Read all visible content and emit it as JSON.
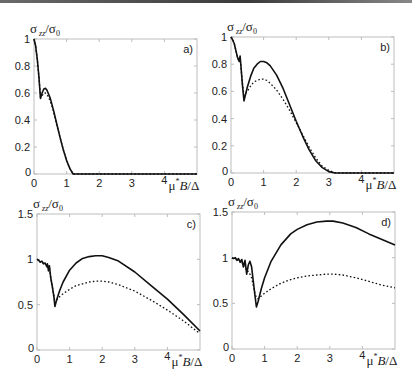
{
  "figure": {
    "ylabel": "σzz/σ0",
    "ylabel_main": "σ",
    "ylabel_sub": "zz",
    "ylabel_den": "σ",
    "ylabel_den_sub": "0",
    "xlabel": "4μ*B/Δ",
    "xlabel_num": "4",
    "xlabel_text": "μ*B/Δ"
  },
  "chart_data": [
    {
      "type": "line",
      "panel": "a)",
      "title": "",
      "ylabel": "σzz/σ0",
      "xlabel": "4μ*B/Δ",
      "xlim": [
        0,
        5
      ],
      "ylim": [
        0,
        1
      ],
      "x_ticks": [
        "0",
        "1",
        "2",
        "3",
        "4"
      ],
      "y_ticks": [
        "0",
        "0.2",
        "0.4",
        "0.6",
        "0.8",
        "1"
      ],
      "y_tick_values": [
        0,
        0.2,
        0.4,
        0.6,
        0.8,
        1
      ],
      "grid": false,
      "series": [
        {
          "name": "solid",
          "style": "solid",
          "x": [
            0,
            0.05,
            0.1,
            0.15,
            0.2,
            0.25,
            0.3,
            0.35,
            0.4,
            0.5,
            0.6,
            0.7,
            0.8,
            0.9,
            1.0,
            1.1,
            1.2,
            1.5,
            2,
            3,
            4,
            5
          ],
          "y": [
            1.0,
            0.95,
            0.85,
            0.72,
            0.56,
            0.6,
            0.63,
            0.635,
            0.62,
            0.56,
            0.47,
            0.37,
            0.27,
            0.18,
            0.1,
            0.04,
            0.0,
            0.0,
            0.0,
            0.0,
            0.0,
            0.0
          ]
        },
        {
          "name": "dotted",
          "style": "dotted",
          "x": [
            0,
            0.05,
            0.1,
            0.15,
            0.2,
            0.25,
            0.3,
            0.35,
            0.4,
            0.5,
            0.6,
            0.7,
            0.8,
            0.9,
            1.0,
            1.1,
            1.2,
            1.5,
            2,
            3,
            4,
            5
          ],
          "y": [
            1.0,
            0.95,
            0.85,
            0.72,
            0.57,
            0.58,
            0.6,
            0.6,
            0.59,
            0.54,
            0.46,
            0.36,
            0.27,
            0.18,
            0.1,
            0.04,
            0.0,
            0.0,
            0.0,
            0.0,
            0.0,
            0.0
          ]
        }
      ]
    },
    {
      "type": "line",
      "panel": "b)",
      "title": "",
      "ylabel": "σzz/σ0",
      "xlabel": "4μ*B/Δ",
      "xlim": [
        0,
        5
      ],
      "ylim": [
        0,
        1
      ],
      "x_ticks": [
        "0",
        "1",
        "2",
        "3",
        "4"
      ],
      "y_ticks": [
        "0",
        "0.2",
        "0.4",
        "0.6",
        "0.8",
        "1"
      ],
      "y_tick_values": [
        0,
        0.2,
        0.4,
        0.6,
        0.8,
        1
      ],
      "grid": false,
      "series": [
        {
          "name": "solid",
          "style": "solid",
          "x": [
            0,
            0.05,
            0.1,
            0.15,
            0.2,
            0.25,
            0.28,
            0.3,
            0.35,
            0.4,
            0.5,
            0.6,
            0.7,
            0.8,
            0.9,
            1.0,
            1.1,
            1.2,
            1.4,
            1.6,
            1.8,
            2.0,
            2.2,
            2.4,
            2.6,
            2.8,
            3.0,
            3.2,
            3.5,
            4,
            5
          ],
          "y": [
            1.0,
            0.98,
            0.95,
            0.9,
            0.85,
            0.82,
            0.86,
            0.8,
            0.65,
            0.53,
            0.63,
            0.71,
            0.77,
            0.8,
            0.82,
            0.82,
            0.81,
            0.79,
            0.72,
            0.62,
            0.5,
            0.38,
            0.27,
            0.17,
            0.09,
            0.04,
            0.01,
            0.0,
            0.0,
            0.0,
            0.0
          ]
        },
        {
          "name": "dotted",
          "style": "dotted",
          "x": [
            0,
            0.05,
            0.1,
            0.15,
            0.2,
            0.25,
            0.28,
            0.3,
            0.35,
            0.4,
            0.5,
            0.6,
            0.7,
            0.8,
            0.9,
            1.0,
            1.1,
            1.2,
            1.4,
            1.6,
            1.8,
            2.0,
            2.2,
            2.4,
            2.6,
            2.8,
            3.0,
            3.2,
            3.5,
            4,
            5
          ],
          "y": [
            1.0,
            0.98,
            0.95,
            0.9,
            0.85,
            0.82,
            0.84,
            0.79,
            0.66,
            0.57,
            0.6,
            0.64,
            0.67,
            0.68,
            0.69,
            0.69,
            0.68,
            0.66,
            0.61,
            0.54,
            0.46,
            0.37,
            0.28,
            0.19,
            0.11,
            0.05,
            0.02,
            0.0,
            0.0,
            0.0,
            0.0
          ]
        }
      ]
    },
    {
      "type": "line",
      "panel": "c)",
      "title": "",
      "ylabel": "σzz/σ0",
      "xlabel": "4μ*B/Δ",
      "xlim": [
        0,
        5
      ],
      "ylim": [
        0,
        1.5
      ],
      "x_ticks": [
        "0",
        "1",
        "2",
        "3",
        "4"
      ],
      "y_ticks": [
        "0",
        "0.5",
        "1",
        "1.5"
      ],
      "y_tick_values": [
        0,
        0.5,
        1,
        1.5
      ],
      "grid": false,
      "series": [
        {
          "name": "solid",
          "style": "solid",
          "x": [
            0,
            0.05,
            0.1,
            0.15,
            0.2,
            0.25,
            0.3,
            0.32,
            0.35,
            0.38,
            0.42,
            0.47,
            0.52,
            0.55,
            0.6,
            0.7,
            0.8,
            1.0,
            1.2,
            1.4,
            1.6,
            1.8,
            1.9,
            2.0,
            2.2,
            2.5,
            3.0,
            3.5,
            4.0,
            4.5,
            5.0
          ],
          "y": [
            1.0,
            0.99,
            0.97,
            0.98,
            0.95,
            0.96,
            0.92,
            0.95,
            0.88,
            0.93,
            0.8,
            0.7,
            0.58,
            0.48,
            0.55,
            0.66,
            0.75,
            0.88,
            0.96,
            1.01,
            1.03,
            1.04,
            1.04,
            1.04,
            1.02,
            0.98,
            0.86,
            0.71,
            0.56,
            0.39,
            0.21
          ]
        },
        {
          "name": "dotted",
          "style": "dotted",
          "x": [
            0,
            0.05,
            0.1,
            0.15,
            0.2,
            0.25,
            0.3,
            0.32,
            0.35,
            0.38,
            0.42,
            0.47,
            0.52,
            0.55,
            0.6,
            0.7,
            0.8,
            1.0,
            1.2,
            1.4,
            1.6,
            1.8,
            1.9,
            2.0,
            2.2,
            2.5,
            3.0,
            3.5,
            4.0,
            4.5,
            5.0
          ],
          "y": [
            1.0,
            0.99,
            0.97,
            0.98,
            0.95,
            0.96,
            0.92,
            0.94,
            0.87,
            0.9,
            0.8,
            0.7,
            0.6,
            0.52,
            0.55,
            0.59,
            0.62,
            0.67,
            0.71,
            0.73,
            0.75,
            0.76,
            0.76,
            0.76,
            0.75,
            0.72,
            0.65,
            0.55,
            0.44,
            0.32,
            0.18
          ]
        }
      ]
    },
    {
      "type": "line",
      "panel": "d)",
      "title": "",
      "ylabel": "σzz/σ0",
      "xlabel": "4μ*B/Δ",
      "xlim": [
        0,
        5
      ],
      "ylim": [
        0,
        1.5
      ],
      "x_ticks": [
        "0",
        "1",
        "2",
        "3",
        "4"
      ],
      "y_ticks": [
        "0",
        "0.5",
        "1",
        "1.5"
      ],
      "y_tick_values": [
        0,
        0.5,
        1,
        1.5
      ],
      "grid": false,
      "series": [
        {
          "name": "solid",
          "style": "solid",
          "x": [
            0,
            0.05,
            0.1,
            0.15,
            0.2,
            0.25,
            0.3,
            0.35,
            0.4,
            0.45,
            0.5,
            0.55,
            0.6,
            0.65,
            0.7,
            0.75,
            0.8,
            0.9,
            1.0,
            1.2,
            1.5,
            1.8,
            2.0,
            2.3,
            2.6,
            2.9,
            3.1,
            3.4,
            3.8,
            4.2,
            4.6,
            5.0
          ],
          "y": [
            1.0,
            0.99,
            1.0,
            0.97,
            0.99,
            0.95,
            0.98,
            0.9,
            0.97,
            0.82,
            0.92,
            0.96,
            0.9,
            0.75,
            0.6,
            0.46,
            0.52,
            0.66,
            0.78,
            0.96,
            1.14,
            1.26,
            1.31,
            1.36,
            1.39,
            1.4,
            1.4,
            1.38,
            1.33,
            1.26,
            1.2,
            1.14
          ]
        },
        {
          "name": "dotted",
          "style": "dotted",
          "x": [
            0,
            0.05,
            0.1,
            0.15,
            0.2,
            0.25,
            0.3,
            0.35,
            0.4,
            0.45,
            0.5,
            0.55,
            0.6,
            0.65,
            0.7,
            0.75,
            0.8,
            0.9,
            1.0,
            1.2,
            1.5,
            1.8,
            2.0,
            2.3,
            2.6,
            2.9,
            3.1,
            3.4,
            3.8,
            4.2,
            4.6,
            5.0
          ],
          "y": [
            1.0,
            0.99,
            1.0,
            0.97,
            0.98,
            0.95,
            0.96,
            0.9,
            0.93,
            0.85,
            0.85,
            0.82,
            0.78,
            0.7,
            0.62,
            0.56,
            0.55,
            0.58,
            0.61,
            0.66,
            0.72,
            0.76,
            0.78,
            0.8,
            0.81,
            0.82,
            0.82,
            0.81,
            0.78,
            0.74,
            0.7,
            0.67
          ]
        }
      ]
    }
  ],
  "layout": {
    "panels": [
      {
        "x0": 34,
        "x1": 197,
        "y0": 39,
        "y1": 174
      },
      {
        "x0": 231,
        "x1": 394,
        "y0": 37,
        "y1": 173
      },
      {
        "x0": 37,
        "x1": 200,
        "y0": 214,
        "y1": 350
      },
      {
        "x0": 232,
        "x1": 395,
        "y0": 212,
        "y1": 349
      }
    ]
  }
}
